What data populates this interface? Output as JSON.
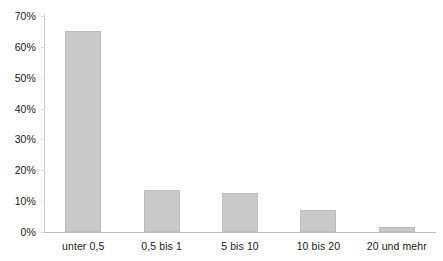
{
  "chart_data": {
    "type": "bar",
    "title": "",
    "subtitle": "",
    "xlabel": "",
    "ylabel": "",
    "categories": [
      "unter 0,5",
      "0,5 bis 1",
      "5 bis 10",
      "10 bis 20",
      "20 und mehr"
    ],
    "values": [
      65,
      13.5,
      12.5,
      7,
      1.5
    ],
    "ylim": [
      0,
      70
    ],
    "ytick_values": [
      0,
      10,
      20,
      30,
      40,
      50,
      60,
      70
    ],
    "ytick_labels": [
      "0%",
      "10%",
      "20%",
      "30%",
      "40%",
      "50%",
      "60%",
      "70%"
    ],
    "grid": false,
    "legend": null,
    "series": [
      {
        "name": "",
        "values": [
          65,
          13.5,
          12.5,
          7,
          1.5
        ]
      }
    ],
    "colors": {
      "bar_fill": "#c9c9c9",
      "bar_border": "#bcbcbc",
      "axis": "#bdbdbd",
      "text": "#1a1a1a",
      "background": "#ffffff"
    }
  }
}
